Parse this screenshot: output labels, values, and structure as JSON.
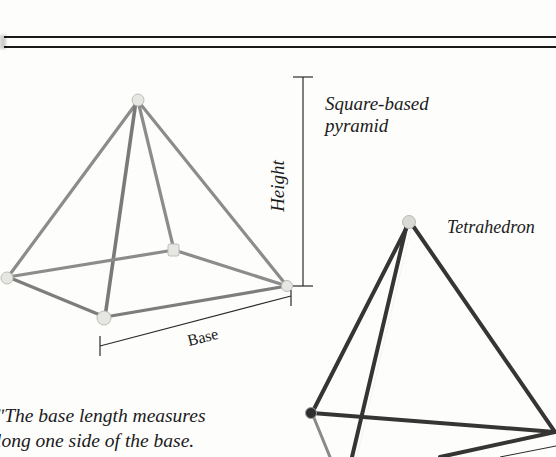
{
  "figure": {
    "shapes": [
      {
        "name": "Square-based pyramid",
        "label_lines": [
          "Square-based",
          "pyramid"
        ],
        "rod_color": "#8a8a8a",
        "joint_color": "#e3e3df"
      },
      {
        "name": "Tetrahedron",
        "label": "Tetrahedron",
        "rod_color": "#3a3a3a",
        "joint_color": "#d8d8d4"
      }
    ],
    "dimensions": {
      "height_label": "Height",
      "base_label": "Base"
    },
    "caption_lines": [
      "The base length measures",
      "along one side of the base."
    ],
    "caption_visible_lines": [
      "ʺThe base length measures",
      "long one side of the base."
    ]
  }
}
